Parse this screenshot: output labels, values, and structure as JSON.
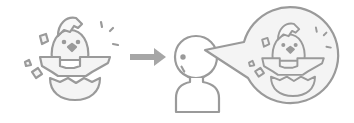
{
  "illustration": {
    "description": "Hatching chick is seen by a person who imagines/talks about the hatching chick",
    "colors": {
      "stroke": "#9a9a9a",
      "fill_light": "#f2f2f2",
      "arrow": "#a6a6a6",
      "background": "#ffffff"
    },
    "elements": [
      {
        "name": "hatching-chick",
        "icon": "chick-hatching-icon"
      },
      {
        "name": "arrow",
        "icon": "arrow-right-icon"
      },
      {
        "name": "person",
        "icon": "person-icon"
      },
      {
        "name": "speech-bubble",
        "icon": "speech-bubble-icon",
        "contains": "chick-hatching-icon"
      }
    ]
  }
}
